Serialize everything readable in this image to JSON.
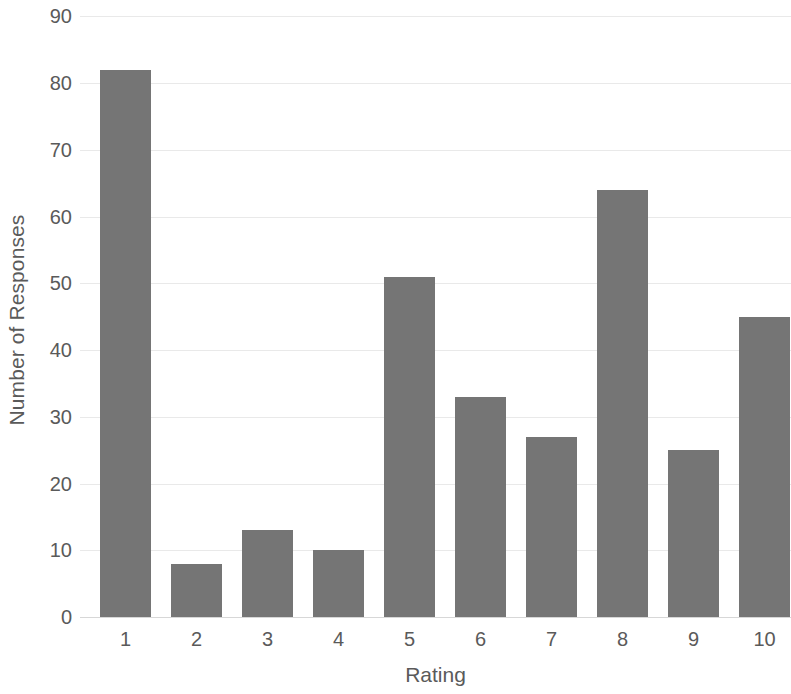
{
  "chart_data": {
    "type": "bar",
    "title": "",
    "xlabel": "Rating",
    "ylabel": "Number of Responses",
    "categories": [
      "1",
      "2",
      "3",
      "4",
      "5",
      "6",
      "7",
      "8",
      "9",
      "10"
    ],
    "values": [
      82,
      8,
      13,
      10,
      51,
      33,
      27,
      64,
      25,
      45
    ],
    "series": [
      {
        "name": "Number of Responses",
        "values": [
          82,
          8,
          13,
          10,
          51,
          33,
          27,
          64,
          25,
          45
        ]
      }
    ],
    "ylim": [
      0,
      90
    ],
    "y_ticks": [
      0,
      10,
      20,
      30,
      40,
      50,
      60,
      70,
      80,
      90
    ],
    "y_tick_labels": [
      "0",
      "10",
      "20",
      "30",
      "40",
      "50",
      "60",
      "70",
      "80",
      "90"
    ],
    "grid": true,
    "grid_axis": "y",
    "legend": false,
    "legend_position": "none",
    "bar_color": "#757575",
    "gridline_color": "#e9e9e9",
    "text_color": "#5a5a5a",
    "background_color": "#ffffff"
  }
}
